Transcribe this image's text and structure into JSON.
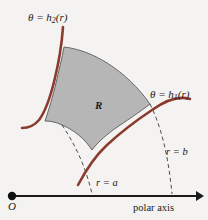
{
  "figure": {
    "type": "polar-region-diagram",
    "background_color": "#f4f3f1",
    "curve_color": "#8B3A2E",
    "region_fill_color": "#b6b6b6",
    "region_outline_color": "#555555",
    "axis_color": "#1a1a1a",
    "dashed_arc_color": "#3a3a3a",
    "labels": {
      "theta_upper": "θ = h₂(r)",
      "theta_lower": "θ = h₁(r)",
      "radius_inner": "r = a",
      "radius_outer": "r = b",
      "region": "R",
      "origin": "O",
      "axis": "polar axis"
    },
    "label_parts": {
      "theta_symbol": "θ",
      "equals": "=",
      "h_symbol": "h",
      "sub_two": "2",
      "sub_one": "1",
      "of_r": "(r)",
      "r_symbol": "r",
      "a_symbol": "a",
      "b_symbol": "b"
    },
    "geometry": {
      "origin_point": [
        12,
        196
      ],
      "axis_start": [
        12,
        196
      ],
      "axis_end": [
        200,
        196
      ],
      "arrow_tip_x": 200,
      "inner_radius_a": 82,
      "outer_radius_b": 161,
      "arc_inner_axis_x": 93,
      "arc_outer_axis_x": 172
    }
  }
}
